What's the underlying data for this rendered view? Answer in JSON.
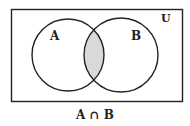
{
  "diagram": {
    "type": "venn",
    "universe_label": "U",
    "sets": [
      {
        "label": "A"
      },
      {
        "label": "B"
      }
    ],
    "shaded_region": "intersection",
    "caption": "A ∩ B",
    "colors": {
      "stroke": "#222222",
      "shade": "#d9d9d9",
      "background": "#ffffff"
    }
  }
}
